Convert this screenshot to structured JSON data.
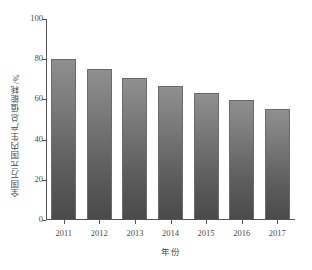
{
  "chart_data": {
    "type": "bar",
    "title": "",
    "subtitle": "",
    "xlabel": "年份",
    "ylabel": "全国万元国内生产总值能耗/%",
    "categories": [
      "2011",
      "2012",
      "2013",
      "2014",
      "2015",
      "2016",
      "2017"
    ],
    "values": [
      79.5,
      74.5,
      70.0,
      66.0,
      62.5,
      59.0,
      54.5
    ],
    "series": [
      {
        "name": "全国万元国内生产总值能耗",
        "values": [
          79.5,
          74.5,
          70.0,
          66.0,
          62.5,
          59.0,
          54.5
        ]
      }
    ],
    "ylim": [
      0,
      100
    ],
    "yticks": [
      0,
      20,
      40,
      60,
      80,
      100
    ],
    "ytick_labels": [
      "0",
      "20",
      "40",
      "60",
      "80",
      "100"
    ],
    "xtick_labels": [
      "2011",
      "2012",
      "2013",
      "2014",
      "2015",
      "2016",
      "2017"
    ],
    "grid": false,
    "legend": false,
    "legend_position": "none",
    "annotations": [],
    "colors": {
      "bar_top": "#8f8f8f",
      "bar_bottom": "#4a4a4a",
      "bar_edge": "#6a6a6a",
      "axis": "#555555",
      "text": "#4a4a4a",
      "background": "#ffffff"
    }
  }
}
